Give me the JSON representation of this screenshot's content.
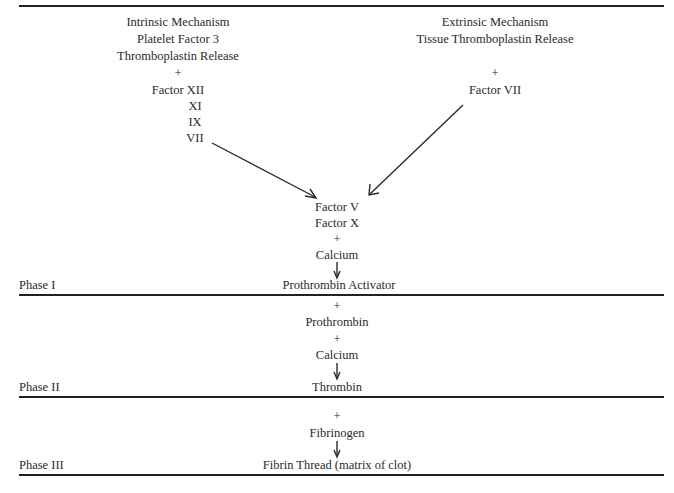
{
  "intrinsic": {
    "lines": [
      "Intrinsic Mechanism",
      "Platelet Factor 3",
      "Thromboplastin Release",
      "+",
      "Factor XII",
      "XI",
      "IX",
      "VII"
    ]
  },
  "extrinsic": {
    "lines": [
      "Extrinsic Mechanism",
      "Tissue Thromboplastin Release",
      "+",
      "Factor VII"
    ]
  },
  "phase1": {
    "label": "Phase I",
    "inputs": [
      "Factor V",
      "Factor X",
      "+",
      "Calcium"
    ],
    "product": "Prothrombin Activator"
  },
  "phase2": {
    "label": "Phase II",
    "inputs": [
      "+",
      "Prothrombin",
      "+",
      "Calcium"
    ],
    "product": "Thrombin"
  },
  "phase3": {
    "label": "Phase III",
    "inputs": [
      "+",
      "Fibrinogen"
    ],
    "product": "Fibrin Thread (matrix of clot)"
  },
  "colors": {
    "ink": "#2a2a2a",
    "background": "#ffffff"
  }
}
